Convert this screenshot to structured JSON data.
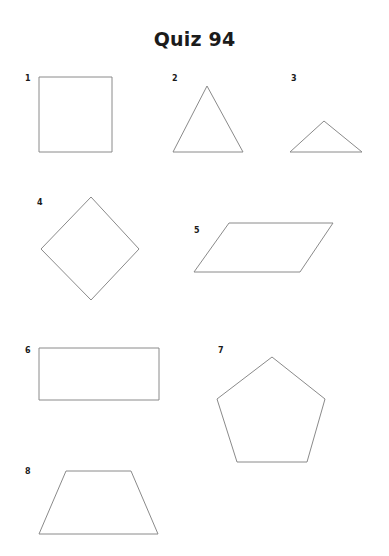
{
  "document": {
    "title": "Quiz 94",
    "background_color": "#ffffff",
    "text_color": "#1b1b1b",
    "stroke_color": "#8a8a8a",
    "width": 389,
    "height": 556
  },
  "shapes": [
    {
      "number": "1",
      "name": "square",
      "label_x": 25,
      "label_y": 75,
      "points": "39,77 112,77 112,152 39,152"
    },
    {
      "number": "2",
      "name": "triangle-equilateral",
      "label_x": 172,
      "label_y": 75,
      "points": "207,86 243,152 173,152"
    },
    {
      "number": "3",
      "name": "triangle-obtuse-wide",
      "label_x": 291,
      "label_y": 75,
      "points": "324,121 362,152 290,152"
    },
    {
      "number": "4",
      "name": "rhombus-diamond",
      "label_x": 37,
      "label_y": 199,
      "points": "91,197 139,249 91,300 41,249"
    },
    {
      "number": "5",
      "name": "parallelogram",
      "label_x": 194,
      "label_y": 227,
      "points": "229,223 333,223 300,272 194,272"
    },
    {
      "number": "6",
      "name": "rectangle",
      "label_x": 25,
      "label_y": 347,
      "points": "39,348 159,348 159,400 39,400"
    },
    {
      "number": "7",
      "name": "pentagon",
      "label_x": 218,
      "label_y": 347,
      "points": "272,357 325,399 307,462 237,462 217,399"
    },
    {
      "number": "8",
      "name": "trapezoid",
      "label_x": 25,
      "label_y": 468,
      "points": "66,471 131,471 158,534 39,534"
    }
  ]
}
